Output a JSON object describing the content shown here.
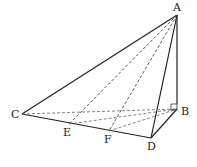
{
  "figure": {
    "type": "tetrahedron",
    "points": {
      "A": {
        "label": "A",
        "x": 177,
        "y": 15
      },
      "B": {
        "label": "B",
        "x": 177,
        "y": 109
      },
      "C": {
        "label": "C",
        "x": 22,
        "y": 114
      },
      "D": {
        "label": "D",
        "x": 151,
        "y": 138
      },
      "E": {
        "label": "E",
        "x": 69,
        "y": 124
      },
      "F": {
        "label": "F",
        "x": 109,
        "y": 131
      }
    },
    "solid_edges": [
      [
        "A",
        "C"
      ],
      [
        "A",
        "D"
      ],
      [
        "A",
        "B"
      ],
      [
        "C",
        "D"
      ],
      [
        "D",
        "B"
      ]
    ],
    "dashed_edges": [
      [
        "A",
        "E"
      ],
      [
        "A",
        "F"
      ],
      [
        "C",
        "B"
      ],
      [
        "E",
        "B"
      ],
      [
        "F",
        "B"
      ]
    ],
    "right_angle_at": "B",
    "line_color": "#222222",
    "dashed_color": "#555555"
  }
}
